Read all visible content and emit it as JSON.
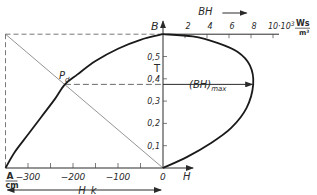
{
  "chart_data": {
    "type": "line",
    "title": "",
    "x_axis_left": {
      "label": "H_k",
      "unit": "A/cm",
      "unit_numerator": "A",
      "unit_denominator": "cm",
      "ticks": [
        -300,
        -250,
        -200,
        -150,
        -100,
        -50,
        0
      ],
      "tick_labels": [
        "-300",
        "-200",
        "-100",
        "0"
      ],
      "range": [
        -350,
        0
      ],
      "right_label": "H"
    },
    "x_axis_top": {
      "label": "BH",
      "unit": "10^3 Ws/m^3",
      "unit_prefix": "·10",
      "unit_exp": "3",
      "unit_numerator": "Ws",
      "unit_denominator": "m³",
      "ticks": [
        2,
        4,
        6,
        8,
        10
      ],
      "tick_labels": [
        "2",
        "4",
        "6",
        "8",
        "10"
      ],
      "range": [
        0,
        10
      ]
    },
    "y_axis": {
      "label": "B",
      "unit": "T",
      "ticks": [
        0.1,
        0.2,
        0.3,
        0.4,
        0.5
      ],
      "tick_labels": [
        "0,1",
        "0,2",
        "0,3",
        "0,4",
        "0,5"
      ],
      "range": [
        0,
        0.6
      ]
    },
    "series": [
      {
        "name": "demagnetization curve",
        "x": [
          -350,
          -330,
          -300,
          -270,
          -240,
          -218,
          -190,
          -150,
          -100,
          -50,
          0
        ],
        "y": [
          0,
          0.07,
          0.15,
          0.23,
          0.31,
          0.375,
          0.42,
          0.48,
          0.535,
          0.575,
          0.6
        ]
      },
      {
        "name": "energy product curve",
        "x": [
          0,
          2.2,
          4.3,
          6.2,
          7.6,
          8.2,
          7.9,
          6.8,
          5,
          2.7,
          0
        ],
        "y": [
          0,
          0.05,
          0.11,
          0.18,
          0.27,
          0.375,
          0.46,
          0.52,
          0.56,
          0.59,
          0.6
        ]
      }
    ],
    "annotations": {
      "point": {
        "label": "P",
        "subscript": "d",
        "H": -218,
        "B": 0.375
      },
      "bhmax": {
        "label": "(BH)",
        "subscript": "max",
        "value": 8.2,
        "B": 0.375
      },
      "remanence_B": 0.6,
      "coercivity_H": -350
    }
  }
}
